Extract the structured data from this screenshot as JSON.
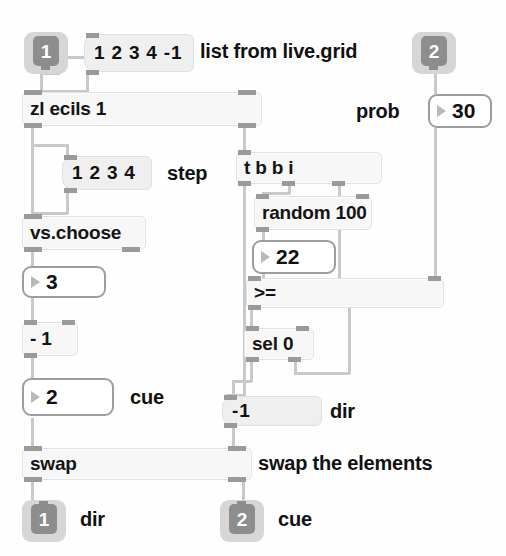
{
  "patcher": {
    "title": "Max patcher - swap elements with probability",
    "background": "#fefefe",
    "cord_color": "#c9c9c9"
  },
  "io_objects": [
    {
      "name": "inlet-1-top",
      "kind": "inlet",
      "label": "1"
    },
    {
      "name": "inlet-2-top",
      "kind": "inlet",
      "label": "2"
    },
    {
      "name": "outlet-1-dir",
      "kind": "outlet",
      "label": "1"
    },
    {
      "name": "outlet-2-cue",
      "kind": "outlet",
      "label": "2"
    }
  ],
  "objects": {
    "zl_ecils": "zl ecils 1",
    "vs_choose": "vs.choose",
    "minus_one": "- 1",
    "swap": "swap",
    "trigger": "t b b i",
    "random": "random 100",
    "greater_equal": ">=",
    "sel_zero": "sel 0"
  },
  "messages": {
    "list_msg": "1 2 3 4 -1",
    "step_msg": "1 2 3 4",
    "dir_msg": "-1"
  },
  "number_boxes": {
    "step_value": "3",
    "cue_value": "2",
    "random_value": "22",
    "prob_value": "30"
  },
  "comments": {
    "list_from": "list from live.grid",
    "step": "step",
    "cue": "cue",
    "prob": "prob",
    "dir_mid": "dir",
    "swap_elements": "swap the elements",
    "outlet_dir": "dir",
    "outlet_cue": "cue"
  }
}
